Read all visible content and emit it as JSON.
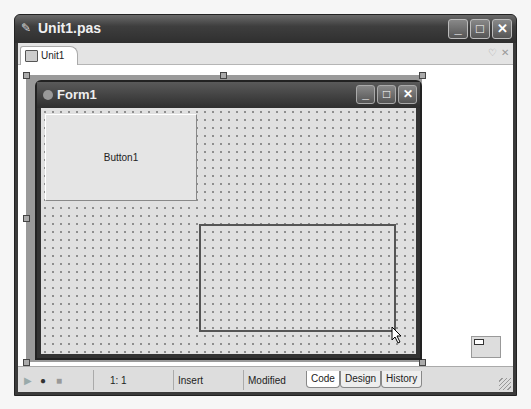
{
  "window": {
    "title": "Unit1.pas",
    "title_icon": "edit-file-icon",
    "controls": [
      "_",
      "□",
      "✕"
    ]
  },
  "tabs": [
    {
      "label": "Unit1",
      "icon": "unit-file-icon"
    }
  ],
  "tab_controls": {
    "dropdown": "♡",
    "close": "✕"
  },
  "form": {
    "title": "Form1",
    "controls": [
      "_",
      "□",
      "✕"
    ],
    "button1": {
      "caption": "Button1"
    }
  },
  "status": {
    "position": "1:  1",
    "mode": "Insert",
    "state": "Modified",
    "view_tabs": [
      {
        "label": "Code",
        "active": true
      },
      {
        "label": "Design",
        "active": false
      },
      {
        "label": "History",
        "active": false
      }
    ],
    "macro_buttons": {
      "play": "▶",
      "record": "●",
      "stop": "■"
    }
  }
}
